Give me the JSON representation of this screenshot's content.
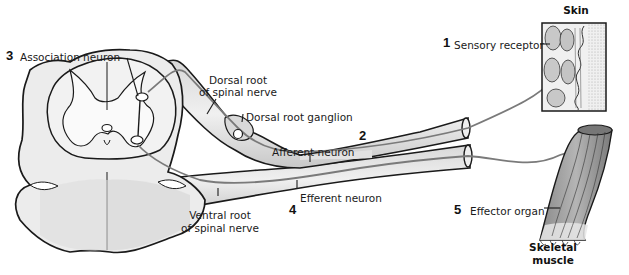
{
  "diagram": {
    "colors": {
      "outline": "#1a1a1a",
      "tissue_fill": "#e6e6e6",
      "tissue_shade": "#cfcfcf",
      "neuron_line": "#7a7a7a",
      "background": "#ffffff"
    },
    "steps": [
      {
        "number": "1",
        "label": "Sensory receptor"
      },
      {
        "number": "2",
        "label": "Afferent neuron"
      },
      {
        "number": "3",
        "label": "Association neuron"
      },
      {
        "number": "4",
        "label": "Efferent neuron"
      },
      {
        "number": "5",
        "label": "Effector organ"
      }
    ],
    "labels": {
      "dorsal_root_line1": "Dorsal root",
      "dorsal_root_line2": "of spinal nerve",
      "dorsal_root_ganglion": "Dorsal root ganglion",
      "ventral_root_line1": "Ventral root",
      "ventral_root_line2": "of spinal nerve",
      "skin": "Skin",
      "skeletal_muscle_line1": "Skeletal",
      "skeletal_muscle_line2": "muscle"
    }
  }
}
